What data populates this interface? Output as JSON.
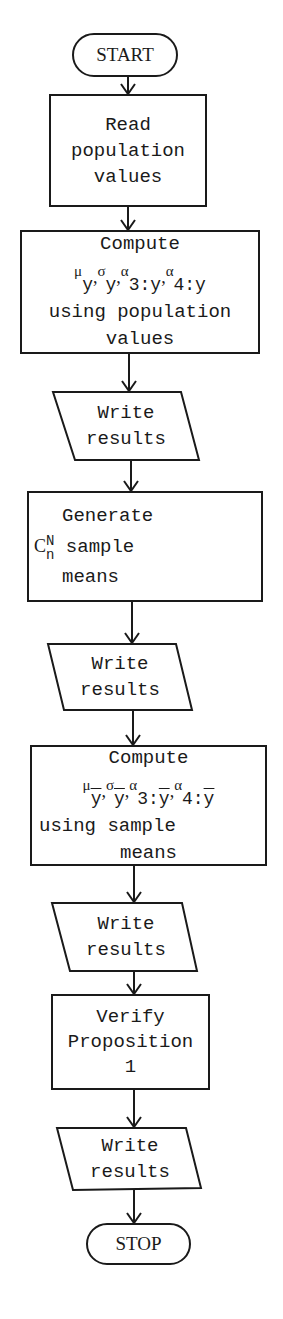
{
  "flowchart": {
    "nodes": [
      {
        "id": "start",
        "type": "terminator",
        "lines": [
          "START"
        ]
      },
      {
        "id": "read",
        "type": "process",
        "lines": [
          "Read",
          "population",
          "values"
        ]
      },
      {
        "id": "compute-pop",
        "type": "process",
        "lines": [
          "Compute",
          "μy,σy,α3:y,α4:y",
          "using population",
          "values"
        ]
      },
      {
        "id": "write-1",
        "type": "io",
        "lines": [
          "Write",
          "results"
        ]
      },
      {
        "id": "generate",
        "type": "process",
        "lines": [
          "Generate",
          "C(N,n) sample",
          "means"
        ]
      },
      {
        "id": "write-2",
        "type": "io",
        "lines": [
          "Write",
          "results"
        ]
      },
      {
        "id": "compute-sample",
        "type": "process",
        "lines": [
          "Compute",
          "μȳ,σȳ,α3:ȳ,α4:ȳ",
          "using sample",
          "means"
        ]
      },
      {
        "id": "write-3",
        "type": "io",
        "lines": [
          "Write",
          "results"
        ]
      },
      {
        "id": "verify",
        "type": "process",
        "lines": [
          "Verify",
          "Proposition",
          "1"
        ]
      },
      {
        "id": "write-4",
        "type": "io",
        "lines": [
          "Write",
          "results"
        ]
      },
      {
        "id": "stop",
        "type": "terminator",
        "lines": [
          "STOP"
        ]
      }
    ],
    "edges": [
      [
        "start",
        "read"
      ],
      [
        "read",
        "compute-pop"
      ],
      [
        "compute-pop",
        "write-1"
      ],
      [
        "write-1",
        "generate"
      ],
      [
        "generate",
        "write-2"
      ],
      [
        "write-2",
        "compute-sample"
      ],
      [
        "compute-sample",
        "write-3"
      ],
      [
        "write-3",
        "verify"
      ],
      [
        "verify",
        "write-4"
      ],
      [
        "write-4",
        "stop"
      ]
    ],
    "math": {
      "mu": "μ",
      "sigma": "σ",
      "alpha": "α",
      "sub_y": "y",
      "sub_3y": "3:y",
      "sub_4y": "4:y",
      "sub_3ybar": "3:",
      "sub_4ybar": "4:",
      "ybar": "y",
      "comb_C": "C",
      "comb_N": "N",
      "comb_n": "n",
      "comma": ","
    },
    "text": {
      "start": "START",
      "read_1": "Read",
      "read_2": "population",
      "read_3": "values",
      "cp_1": "Compute",
      "cp_3": "using population",
      "cp_4": "values",
      "write": "Write",
      "results": "results",
      "gen_1": "Generate",
      "gen_2": "sample",
      "gen_3": "means",
      "cs_1": "Compute",
      "cs_3": "using sample",
      "cs_4": "means",
      "ver_1": "Verify",
      "ver_2": "Proposition",
      "ver_3": "1",
      "stop": "STOP"
    },
    "colors": {
      "stroke": "#1a1a1a",
      "background": "#ffffff"
    }
  }
}
